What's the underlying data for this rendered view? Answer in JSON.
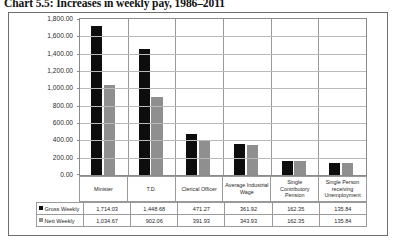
{
  "title": "Chart 5.5: Increases in weekly pay, 1986–2011",
  "chart_data": {
    "type": "bar",
    "title": "Chart 5.5: Increases in weekly pay, 1986–2011",
    "xlabel": "",
    "ylabel": "",
    "ylim": [
      0,
      1800
    ],
    "ytick_step": 200,
    "grid": true,
    "legend_position": "table-bottom",
    "categories": [
      "Minister",
      "T.D.",
      "Clerical Officer",
      "Average Industrial Wage",
      "Single Contributory Pension",
      "Single Person receiving Unemployment"
    ],
    "series": [
      {
        "name": "Gross Weekly",
        "color": "#0d0d0d",
        "values": [
          1714.03,
          1448.68,
          471.27,
          361.92,
          162.35,
          135.84
        ],
        "labels": [
          "1,714.03",
          "1,448.68",
          "471.27",
          "361.92",
          "162.35",
          "135.84"
        ]
      },
      {
        "name": "Nett Weekly",
        "color": "#8f8f8f",
        "values": [
          1034.67,
          902.06,
          391.93,
          343.93,
          162.35,
          135.84
        ],
        "labels": [
          "1,034.67",
          "902.06",
          "391.93",
          "343.93",
          "162.35",
          "135.84"
        ]
      }
    ],
    "ytick_labels": [
      "1,800.00",
      "1,600.00",
      "1,400.00",
      "1,200.00",
      "1,000.00",
      "800.00",
      "600.00",
      "400.00",
      "200.00",
      "0.00"
    ]
  }
}
